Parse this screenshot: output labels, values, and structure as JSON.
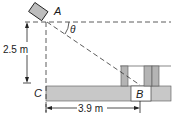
{
  "diagram": {
    "points": {
      "A": "A",
      "B": "B",
      "C": "C"
    },
    "angle_label": "θ",
    "height_label": "2.5 m",
    "distance_label": "3.9 m",
    "colors": {
      "ground": "#c8c8c8",
      "post": "#b4b4b4",
      "line": "#222222",
      "camera": "#bdbdbd"
    },
    "icons": {
      "camera": "camera-box"
    }
  }
}
